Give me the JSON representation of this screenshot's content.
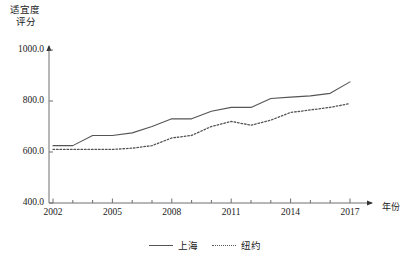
{
  "chart_data": {
    "type": "line",
    "title": "",
    "ylabel_lines": [
      "适宜度",
      "评分"
    ],
    "xlabel": "年份",
    "grid": false,
    "legend_position": "bottom-center",
    "xlim": [
      2002,
      2017
    ],
    "ylim": [
      400,
      1000
    ],
    "ytick_labels": [
      "1000.0",
      "800.0",
      "600.0",
      "400.0"
    ],
    "ytick_values": [
      1000,
      800,
      600,
      400
    ],
    "xtick_labels": [
      "2002",
      "2005",
      "2008",
      "2011",
      "2014",
      "2017"
    ],
    "xtick_values": [
      2002,
      2005,
      2008,
      2011,
      2014,
      2017
    ],
    "x": [
      2002,
      2003,
      2004,
      2005,
      2006,
      2007,
      2008,
      2009,
      2010,
      2011,
      2012,
      2013,
      2014,
      2015,
      2016,
      2017
    ],
    "series": [
      {
        "name": "上海",
        "style": "solid",
        "color": "#555555",
        "values": [
          625,
          625,
          665,
          665,
          675,
          700,
          730,
          730,
          760,
          775,
          775,
          810,
          815,
          820,
          830,
          875
        ]
      },
      {
        "name": "纽约",
        "style": "dotted",
        "color": "#555555",
        "values": [
          610,
          610,
          610,
          610,
          615,
          625,
          655,
          665,
          700,
          720,
          705,
          725,
          755,
          765,
          775,
          790
        ]
      }
    ],
    "axis_color": "#6f6f6f",
    "geometry": {
      "x_left_px": 53,
      "x_right_px": 350,
      "y_top_px": 50,
      "y_bottom_px": 203,
      "axis_x_px": 49,
      "x_axis_end_px": 372,
      "y_axis_top_px": 46
    }
  }
}
